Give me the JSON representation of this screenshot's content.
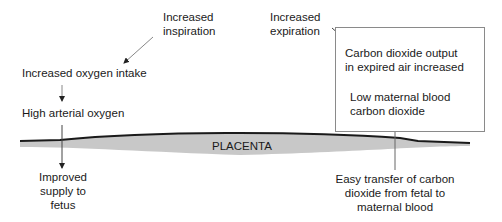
{
  "diagram": {
    "left": {
      "increased_inspiration": [
        "Increased",
        "inspiration"
      ],
      "increased_oxygen_intake": "Increased oxygen intake",
      "high_arterial_oxygen": "High arterial oxygen",
      "improved_supply": [
        "Improved",
        "supply to",
        "fetus"
      ]
    },
    "right": {
      "increased_expiration": [
        "Increased",
        "expiration"
      ],
      "co2_output": [
        "Carbon dioxide output",
        "in expired air increased"
      ],
      "low_maternal_co2": [
        "Low maternal blood",
        "carbon dioxide"
      ],
      "easy_transfer": [
        "Easy transfer of carbon",
        "dioxide from fetal to",
        "maternal blood"
      ]
    },
    "placenta_label": "PLACENTA",
    "colors": {
      "line": "#1a1a1a",
      "placenta_fill": "#c8c8c8",
      "box_border": "#8a8a8a",
      "arrow": "#333333"
    }
  }
}
